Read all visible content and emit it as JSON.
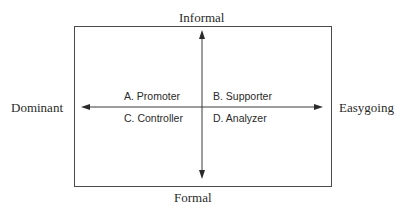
{
  "diagram": {
    "type": "quadrant",
    "axes": {
      "vertical": {
        "top_label": "Informal",
        "bottom_label": "Formal"
      },
      "horizontal": {
        "left_label": "Dominant",
        "right_label": "Easygoing"
      }
    },
    "quadrants": [
      {
        "position": "top-left",
        "label": "A. Promoter"
      },
      {
        "position": "top-right",
        "label": "B. Supporter"
      },
      {
        "position": "bottom-left",
        "label": "C. Controller"
      },
      {
        "position": "bottom-right",
        "label": "D. Analyzer"
      }
    ],
    "colors": {
      "line": "#3a3a3a",
      "text": "#2a2a2a",
      "background": "#ffffff"
    }
  }
}
